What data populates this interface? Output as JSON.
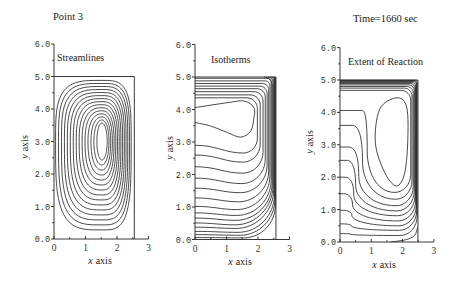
{
  "chart_data": {
    "type": "contour",
    "titles": [
      "Point 3",
      "Time=1660 sec"
    ],
    "panels": [
      {
        "kind": "streamlines",
        "label": "Streamlines",
        "xlabel": {
          "symbol": "x",
          "text": "axis"
        },
        "ylabel": {
          "symbol": "y",
          "text": "axis"
        },
        "xlim": [
          0,
          3
        ],
        "ylim": [
          0,
          6
        ],
        "xticks": [
          0,
          1,
          2,
          3
        ],
        "xtick_labels": [
          "0",
          "1",
          "2",
          "3"
        ],
        "yticks": [
          0,
          1,
          2,
          3,
          4,
          5,
          6
        ],
        "ytick_labels": [
          "0.0",
          "1.0",
          "2.0",
          "3.0",
          "4.0",
          "5.0",
          "6.0"
        ],
        "minor_tick_step": 0.5,
        "domain": {
          "x": [
            0,
            2.55
          ],
          "y": [
            0,
            5.0
          ]
        },
        "vortex": {
          "center": [
            1.52,
            3.0
          ],
          "levels": 15,
          "outer": {
            "left": 1.47,
            "right": 0.93,
            "top": 1.88,
            "bottom": 2.72,
            "squareness": 3.6
          },
          "inner": {
            "left": 0.16,
            "right": 0.17,
            "top": 0.57,
            "bottom": 0.57,
            "squareness": 2.0
          }
        }
      },
      {
        "kind": "isotherms",
        "label": "Isotherms",
        "xlabel": {
          "symbol": "x",
          "text": "axis"
        },
        "ylabel": {
          "symbol": "y",
          "text": "axis"
        },
        "xlim": [
          0,
          3
        ],
        "ylim": [
          0,
          6
        ],
        "xticks": [
          0,
          1,
          2,
          3
        ],
        "xtick_labels": [
          "0",
          "1",
          "2",
          "3"
        ],
        "yticks": [
          0,
          1,
          2,
          3,
          4,
          5,
          6
        ],
        "ytick_labels": [
          "0.0",
          "1.0",
          "2.0",
          "3.0",
          "4.0",
          "5.0",
          "6.0"
        ],
        "minor_tick_step": 0.5,
        "domain": {
          "x": [
            0,
            2.57
          ],
          "y": [
            0,
            5.0
          ]
        },
        "isotherms": {
          "pocket": [
            [
              0,
              4.06
            ],
            [
              1.03,
              4.21
            ],
            [
              1.56,
              4.26
            ],
            [
              1.87,
              4.06
            ],
            [
              1.87,
              3.75
            ],
            [
              1.77,
              3.34
            ],
            [
              1.45,
              3.15
            ],
            [
              1.03,
              3.29
            ],
            [
              0.5,
              3.49
            ],
            [
              0,
              3.6
            ]
          ],
          "lines": [
            {
              "y_left": 2.9,
              "dip": 0.24,
              "x_rise": 1.98,
              "turn_radius": 0.45,
              "y_top": 4.36,
              "corner_radius": 0.33
            },
            {
              "y_left": 2.6,
              "dip": 0.22,
              "x_rise": 2.07,
              "turn_radius": 0.55,
              "y_top": 4.45,
              "corner_radius": 0.31
            },
            {
              "y_left": 2.24,
              "dip": 0.2,
              "x_rise": 2.16,
              "turn_radius": 0.65,
              "y_top": 4.55,
              "corner_radius": 0.29
            },
            {
              "y_left": 1.89,
              "dip": 0.17,
              "x_rise": 2.23,
              "turn_radius": 0.75,
              "y_top": 4.64,
              "corner_radius": 0.26
            },
            {
              "y_left": 1.58,
              "dip": 0.14,
              "x_rise": 2.29,
              "turn_radius": 0.85,
              "y_top": 4.72,
              "corner_radius": 0.23
            },
            {
              "y_left": 1.28,
              "dip": 0.12,
              "x_rise": 2.34,
              "turn_radius": 0.95,
              "y_top": 4.8,
              "corner_radius": 0.19
            },
            {
              "y_left": 1.02,
              "dip": 0.1,
              "x_rise": 2.38,
              "turn_radius": 1.05,
              "y_top": 4.88,
              "corner_radius": 0.15
            },
            {
              "y_left": 0.82,
              "dip": 0.08,
              "x_rise": 2.42,
              "turn_radius": 1.1,
              "y_top": 4.96,
              "corner_radius": 0.11
            },
            {
              "y_left": 0.66,
              "dip": 0.07,
              "x_rise": 2.45,
              "turn_radius": 1.15,
              "x_end": 2.2
            },
            {
              "y_left": 0.51,
              "dip": 0.06,
              "x_rise": 2.475,
              "turn_radius": 1.2,
              "x_end": 2.32
            },
            {
              "y_left": 0.38,
              "dip": 0.04,
              "x_rise": 2.5,
              "turn_radius": 1.2,
              "x_end": 2.4
            },
            {
              "y_left": 0.25,
              "dip": 0.03,
              "x_rise": 2.52,
              "turn_radius": 1.15,
              "x_end": 2.46
            },
            {
              "y_left": 0.15,
              "dip": 0.02,
              "x_rise": 2.535,
              "turn_radius": 1.1,
              "x_end": 2.5
            },
            {
              "y_left": 0.06,
              "dip": 0.01,
              "x_rise": 2.55,
              "turn_radius": 1.0,
              "x_end": 2.53
            }
          ]
        }
      },
      {
        "kind": "extent",
        "label": "Extent of Reaction",
        "xlabel": {
          "symbol": "x",
          "text": "axis"
        },
        "ylabel": {
          "symbol": "y",
          "text": "axis"
        },
        "xlim": [
          0,
          3
        ],
        "ylim": [
          0,
          6
        ],
        "xticks": [
          0,
          1,
          2,
          3
        ],
        "xtick_labels": [
          "0",
          "1",
          "2",
          "3"
        ],
        "yticks": [
          0,
          1,
          2,
          3,
          4,
          5,
          6
        ],
        "ytick_labels": [
          "0.0",
          "1.0",
          "2.0",
          "3.0",
          "4.0",
          "5.0",
          "6.0"
        ],
        "minor_tick_step": 0.5,
        "domain": {
          "x": [
            0,
            2.49
          ],
          "y": [
            0,
            5.0
          ]
        },
        "extent": {
          "core_oval": [
            [
              1.8,
              4.45
            ],
            [
              2.12,
              4.2
            ],
            [
              2.17,
              3.27
            ],
            [
              2.07,
              2.14
            ],
            [
              1.8,
              1.73
            ],
            [
              1.43,
              2.14
            ],
            [
              1.13,
              3.06
            ],
            [
              1.27,
              4.1
            ]
          ],
          "lines": [
            {
              "y_left": 4.06,
              "x_turn": 0.72,
              "x_descent": 0.87,
              "y_descent": 2.8,
              "y_bottom": 1.53,
              "x_bottom": 1.75,
              "x_rise": 2.26,
              "y_top": 4.68,
              "corner_radius": 0.3
            },
            {
              "y_left": 3.6,
              "x_turn": 0.4,
              "x_descent": 0.72,
              "y_descent": 2.46,
              "y_bottom": 1.32,
              "x_bottom": 1.78,
              "x_rise": 2.3,
              "y_top": 4.75,
              "corner_radius": 0.25
            },
            {
              "y_left": 2.93,
              "x_turn": 0.28,
              "x_descent": 0.6,
              "y_descent": 2.02,
              "y_bottom": 1.12,
              "x_bottom": 1.8,
              "x_rise": 2.34,
              "y_top": 4.8,
              "corner_radius": 0.21
            },
            {
              "y_left": 2.52,
              "x_turn": 0.22,
              "x_descent": 0.5,
              "y_descent": 1.74,
              "y_bottom": 0.96,
              "x_bottom": 1.82,
              "x_rise": 2.37,
              "y_top": 4.85,
              "corner_radius": 0.17
            },
            {
              "y_left": 2.0,
              "x_turn": 0.16,
              "x_descent": 0.44,
              "y_descent": 1.45,
              "y_bottom": 0.81,
              "x_bottom": 1.84,
              "x_rise": 2.395,
              "y_top": 4.89,
              "corner_radius": 0.14
            },
            {
              "y_left": 1.49,
              "x_turn": 0.12,
              "x_descent": 0.4,
              "y_descent": 1.15,
              "y_bottom": 0.65,
              "x_bottom": 1.86,
              "x_rise": 2.415,
              "y_top": 4.92,
              "corner_radius": 0.11
            },
            {
              "y_left": 0.98,
              "x_turn": 0.1,
              "x_descent": 0.38,
              "y_descent": 0.82,
              "y_bottom": 0.5,
              "x_bottom": 1.88,
              "x_rise": 2.435,
              "y_top": 4.95,
              "corner_radius": 0.09
            },
            {
              "y_left": 0.56,
              "x_turn": 0.08,
              "x_descent": 0.36,
              "y_descent": 0.5,
              "y_bottom": 0.36,
              "x_bottom": 1.9,
              "x_rise": 2.45,
              "y_top": 4.97,
              "corner_radius": 0.07
            },
            {
              "y_left": 0.26,
              "x_turn": 0.06,
              "x_descent": 0.34,
              "y_descent": 0.24,
              "y_bottom": 0.2,
              "x_bottom": 1.92,
              "x_rise": 2.465,
              "y_top": 4.99,
              "corner_radius": 0.05
            }
          ],
          "extra_lines": [
            [
              [
                1.62,
                0.0
              ],
              [
                2.1,
                0.07
              ],
              [
                2.38,
                0.2
              ],
              [
                2.48,
                0.45
              ]
            ]
          ]
        }
      }
    ]
  }
}
